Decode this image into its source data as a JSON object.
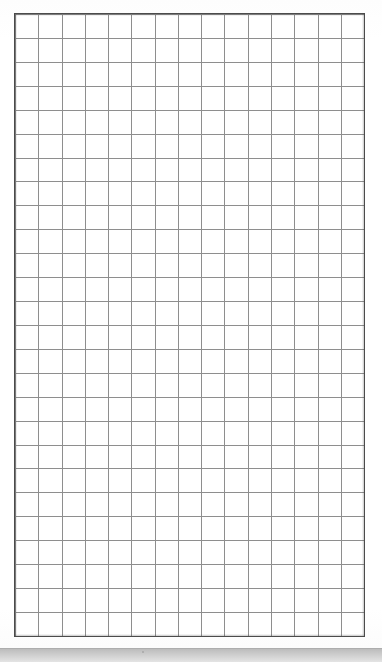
{
  "document": {
    "kind": "scanned-graph-paper",
    "title": "Blank grid sheet",
    "visible_text": "",
    "notes": "No text, labels, numbers, or annotations are present anywhere on the sheet."
  },
  "canvas": {
    "width_px": 382,
    "height_px": 662,
    "background_color": "#fefefe"
  },
  "grid": {
    "columns": 15,
    "rows": 26,
    "cell_width_px": 23.27,
    "cell_height_px": 23.92,
    "left_px": 15,
    "top_px": 14,
    "width_px": 349,
    "height_px": 622,
    "rule_color": "#8e8e8e",
    "rule_width_px": 1,
    "frame_color": "#4f4f4f",
    "frame_width_px": 1.6,
    "cell_fill_color": "#ffffff"
  },
  "margins": {
    "left_px": 15,
    "right_px": 18,
    "top_px": 14,
    "bottom_px": 12,
    "color": "#ffffff"
  },
  "bottom_band": {
    "top_px": 648,
    "height_px": 14,
    "color_start": "#b9b9b9",
    "color_end": "#e4e4e4",
    "hairline_color": "#adadad"
  }
}
